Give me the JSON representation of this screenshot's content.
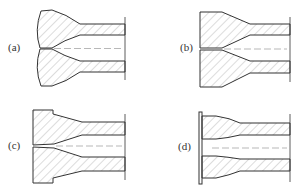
{
  "figure": {
    "panels": [
      {
        "id": "a",
        "label": "(a)",
        "description": "Nozzle with convex curved inlet, converging cone to cylindrical bore"
      },
      {
        "id": "b",
        "label": "(b)",
        "description": "Nozzle with flat inlet face, chamfered corners, converging cone to bore"
      },
      {
        "id": "c",
        "label": "(c)",
        "description": "Nozzle with stepped flange inlet face, converging cone to bore"
      },
      {
        "id": "d",
        "label": "(d)",
        "description": "Nozzle with thin orifice plate at inlet, tapered bore"
      }
    ],
    "colors": {
      "line": "#333333",
      "hatch": "#777777",
      "centerline": "#888888",
      "background": "#ffffff"
    }
  }
}
